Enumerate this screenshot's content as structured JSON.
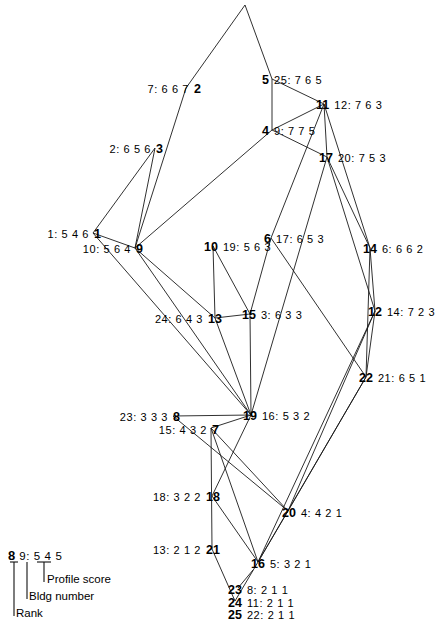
{
  "diagram": {
    "type": "hierarchical-clustering-tree",
    "apex": {
      "id": "apex",
      "x": 245,
      "y": 5,
      "labelled": false
    },
    "nodes": [
      {
        "rank": "2",
        "bldg": "7",
        "profile": "6 6 7",
        "profile_text": "7: 6 6 7",
        "x": 186,
        "y": 88,
        "side": "left"
      },
      {
        "rank": "5",
        "bldg": "25",
        "profile": "7 6 5",
        "profile_text": "25: 7 6 5",
        "x": 272,
        "y": 79,
        "side": "right"
      },
      {
        "rank": "11",
        "bldg": "12",
        "profile": "7 6 3",
        "profile_text": "12: 7 6 3",
        "x": 324,
        "y": 104,
        "side": "right"
      },
      {
        "rank": "4",
        "bldg": "9",
        "profile": "7 7 5",
        "profile_text": "9: 7 7 5",
        "x": 272,
        "y": 130,
        "side": "right"
      },
      {
        "rank": "3",
        "bldg": "2",
        "profile": "6 5 6",
        "profile_text": "2: 6 5 6",
        "x": 155,
        "y": 148,
        "side": "left"
      },
      {
        "rank": "17",
        "bldg": "20",
        "profile": "7 5 3",
        "profile_text": "20: 7 5 3",
        "x": 327,
        "y": 157,
        "side": "right"
      },
      {
        "rank": "1",
        "bldg": "1",
        "profile": "5 4 6",
        "profile_text": "1: 5 4 6",
        "x": 93,
        "y": 233,
        "side": "left"
      },
      {
        "rank": "9",
        "bldg": "10",
        "profile": "5 6 4",
        "profile_text": "10: 5 6 4",
        "x": 135,
        "y": 248,
        "side": "left"
      },
      {
        "rank": "10",
        "bldg": "19",
        "profile": "5 6 3",
        "profile_text": "19: 5 6 3",
        "x": 213,
        "y": 246,
        "side": "right"
      },
      {
        "rank": "6",
        "bldg": "17",
        "profile": "6 5 3",
        "profile_text": "17: 6 5 3",
        "x": 271,
        "y": 238,
        "side": "right"
      },
      {
        "rank": "14",
        "bldg": "6",
        "profile": "6 6 2",
        "profile_text": "6: 6 6 2",
        "x": 370,
        "y": 248,
        "side": "right"
      },
      {
        "rank": "13",
        "bldg": "24",
        "profile": "6 4 3",
        "profile_text": "24: 6 4 3",
        "x": 215,
        "y": 318,
        "side": "left"
      },
      {
        "rank": "15",
        "bldg": "3",
        "profile": "6 3 3",
        "profile_text": "3: 6 3 3",
        "x": 250,
        "y": 314,
        "side": "right"
      },
      {
        "rank": "12",
        "bldg": "14",
        "profile": "7 2 3",
        "profile_text": "14: 7 2 3",
        "x": 375,
        "y": 311,
        "side": "right"
      },
      {
        "rank": "22",
        "bldg": "21",
        "profile": "6 5 1",
        "profile_text": "21: 6 5 1",
        "x": 366,
        "y": 377,
        "side": "right"
      },
      {
        "rank": "8",
        "bldg": "23",
        "profile": "3 3 3",
        "profile_text": "23: 3 3 3",
        "x": 173,
        "y": 416,
        "side": "left"
      },
      {
        "rank": "19",
        "bldg": "16",
        "profile": "5 3 2",
        "profile_text": "16: 5 3 2",
        "x": 251,
        "y": 415,
        "side": "right"
      },
      {
        "rank": "7",
        "bldg": "15",
        "profile": "4 3 2",
        "profile_text": "15: 4 3 2",
        "x": 211,
        "y": 428,
        "side": "left"
      },
      {
        "rank": "18",
        "bldg": "18",
        "profile": "3 2 2",
        "profile_text": "18: 3 2 2",
        "x": 212,
        "y": 496,
        "side": "left"
      },
      {
        "rank": "20",
        "bldg": "4",
        "profile": "4 2 1",
        "profile_text": "4: 4 2 1",
        "x": 288,
        "y": 511,
        "side": "right"
      },
      {
        "rank": "21",
        "bldg": "13",
        "profile": "2 1 2",
        "profile_text": "13: 2 1 2",
        "x": 212,
        "y": 549,
        "side": "left"
      },
      {
        "rank": "16",
        "bldg": "5",
        "profile": "3 2 1",
        "profile_text": "5: 3 2 1",
        "x": 258,
        "y": 562,
        "side": "right"
      },
      {
        "rank": "23",
        "bldg": "8",
        "profile": "2 1 1",
        "profile_text": "8: 2 1 1",
        "x": 238,
        "y": 588,
        "side": "right"
      },
      {
        "rank": "24",
        "bldg": "11",
        "profile": "2 1 1",
        "profile_text": "11: 2 1 1",
        "x": 235,
        "y": 601,
        "side": "right"
      },
      {
        "rank": "25",
        "bldg": "22",
        "profile": "2 1 1",
        "profile_text": "22: 2 1 1",
        "x": 238,
        "y": 613,
        "side": "right"
      }
    ]
  },
  "legend": {
    "rank_value": "8",
    "profile_value": "9: 5 4 5",
    "profile_score_label": "Profile score",
    "bldg_number_label": "Bldg number",
    "rank_label": "Rank"
  }
}
